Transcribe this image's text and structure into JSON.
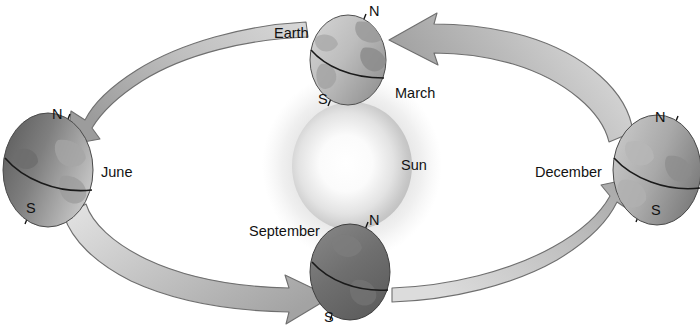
{
  "figure": {
    "title_fragment": "",
    "sun_label": "Sun",
    "earth_label": "Earth",
    "background_color": "#ffffff",
    "ink_color": "#121212",
    "arrow_fill_light": "#e2e2e2",
    "arrow_fill_dark": "#9a9a9a",
    "arrow_stroke": "#6b6b6b",
    "sun_core_color": "#fdfdfd",
    "sun_glow_color": "#b9b9b9"
  },
  "sun": {
    "label": "Sun",
    "label_x": 401,
    "label_y": 158,
    "center_x": 352,
    "center_y": 166,
    "radius_x": 60,
    "radius_y": 64
  },
  "orbit": {
    "center_x": 352,
    "center_y": 166,
    "radius_x": 288,
    "radius_y": 136,
    "direction": "counterclockwise"
  },
  "earths": [
    {
      "id": "march",
      "month_label": "March",
      "month_label_x": 395,
      "month_label_y": 86,
      "north_label": "N",
      "north_label_x": 369,
      "north_label_y": 6,
      "south_label": "S",
      "south_label_x": 318,
      "south_label_y": 92,
      "extra_label": "Earth",
      "extra_label_x": 274,
      "extra_label_y": 26,
      "center_x": 348,
      "center_y": 60,
      "radius_x": 38,
      "radius_y": 45,
      "axis_tilt_deg": 23.5,
      "lit_side": "left",
      "shade": "light"
    },
    {
      "id": "june",
      "month_label": "June",
      "month_label_x": 101,
      "month_label_y": 165,
      "north_label": "N",
      "north_label_x": 52,
      "north_label_y": 107,
      "south_label": "S",
      "south_label_x": 26,
      "south_label_y": 201,
      "center_x": 48,
      "center_y": 170,
      "radius_x": 45,
      "radius_y": 57,
      "axis_tilt_deg": 23.5,
      "lit_side": "right",
      "shade": "dark-left"
    },
    {
      "id": "september",
      "month_label": "September",
      "month_label_x": 249,
      "month_label_y": 224,
      "north_label": "N",
      "north_label_x": 369,
      "north_label_y": 213,
      "south_label": "S",
      "south_label_x": 324,
      "south_label_y": 310,
      "center_x": 350,
      "center_y": 272,
      "radius_x": 40,
      "radius_y": 48,
      "axis_tilt_deg": 23.5,
      "lit_side": "top",
      "shade": "dark"
    },
    {
      "id": "december",
      "month_label": "December",
      "month_label_x": 535,
      "month_label_y": 165,
      "north_label": "N",
      "north_label_x": 655,
      "north_label_y": 110,
      "south_label": "S",
      "south_label_x": 651,
      "south_label_y": 203,
      "center_x": 657,
      "center_y": 170,
      "radius_x": 44,
      "radius_y": 55,
      "axis_tilt_deg": 23.5,
      "lit_side": "left",
      "shade": "light-left"
    }
  ],
  "arrows": [
    {
      "id": "arrow-to-march-from-december",
      "points_to": "march",
      "description": "curved band from December position sweeping up-left, arrowhead at March Earth"
    },
    {
      "id": "arrow-to-june-from-march",
      "points_to": "june",
      "description": "curved band from March position sweeping left, arrowhead at June Earth north pole"
    },
    {
      "id": "arrow-to-september-from-june",
      "points_to": "september",
      "description": "curved band from June position sweeping down-right, arrowhead at September Earth"
    },
    {
      "id": "arrow-to-december-from-september",
      "points_to": "december",
      "description": "curved band from September position sweeping right and up, arrowhead at December Earth"
    }
  ]
}
